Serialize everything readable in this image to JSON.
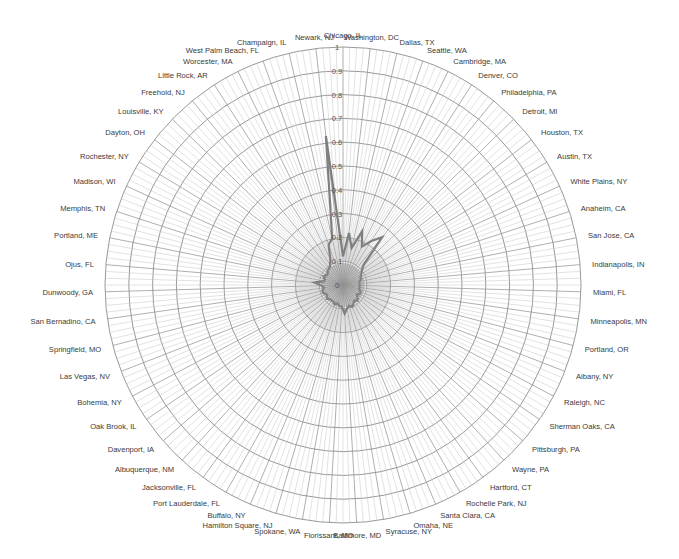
{
  "chart_data": {
    "type": "radar",
    "title": "",
    "axis": {
      "min": 0,
      "max": 1,
      "ticks": [
        0,
        0.1,
        0.2,
        0.3,
        0.4,
        0.5,
        0.6,
        0.7,
        0.8,
        0.9,
        1
      ]
    },
    "grid": true,
    "legend": "none",
    "categories": [
      "Chicago, IL",
      "Washington, DC",
      "Dallas, TX",
      "Seattle, WA",
      "Cambridge, MA",
      "Denver, CO",
      "Philadelphia, PA",
      "Detroit, MI",
      "Houston, TX",
      "Austin, TX",
      "White Plains, NY",
      "Anaheim, CA",
      "San Jose, CA",
      "Indianapolis, IN",
      "Miami, FL",
      "Minneapolis, MN",
      "Portland, OR",
      "Albany, NY",
      "Raleigh, NC",
      "Sherman Oaks, CA",
      "Pittsburgh, PA",
      "Wayne, PA",
      "Hartford, CT",
      "Rochelle Park, NJ",
      "Santa Clara, CA",
      "Omaha, NE",
      "Syracuse, NY",
      "Baltimore, MD",
      "Florissant, MO",
      "Spokane, WA",
      "Hamilton Square, NJ",
      "Buffalo, NY",
      "Port Lauderdale, FL",
      "Jacksonville, FL",
      "Albuquerque, NM",
      "Davenport, IA",
      "Oak Brook, IL",
      "Bohemia, NY",
      "Las Vegas, NV",
      "Springfield, MO",
      "San Bernadino, CA",
      "Dunwoody, GA",
      "Ojus, FL",
      "Portland, ME",
      "Memphis, TN",
      "Madison, WI",
      "Rochester, NY",
      "Dayton, OH",
      "Louisville, KY",
      "Freehold, NJ",
      "Little Rock, AR",
      "Worcester, MA",
      "West Palm Beach, FL",
      "Champaign, IL",
      "Newark, NJ"
    ],
    "series": [
      {
        "name": "Series 1",
        "color": "#7f7f7f",
        "values": [
          0.12,
          0.22,
          0.16,
          0.24,
          0.18,
          0.22,
          0.26,
          0.12,
          0.1,
          0.09,
          0.08,
          0.08,
          0.07,
          0.07,
          0.07,
          0.07,
          0.07,
          0.08,
          0.08,
          0.07,
          0.08,
          0.09,
          0.08,
          0.09,
          0.1,
          0.09,
          0.1,
          0.12,
          0.09,
          0.09,
          0.08,
          0.09,
          0.08,
          0.08,
          0.08,
          0.09,
          0.08,
          0.08,
          0.09,
          0.09,
          0.08,
          0.09,
          0.12,
          0.08,
          0.08,
          0.09,
          0.08,
          0.08,
          0.09,
          0.09,
          0.1,
          0.12,
          0.18,
          0.2,
          0.63
        ]
      }
    ]
  }
}
